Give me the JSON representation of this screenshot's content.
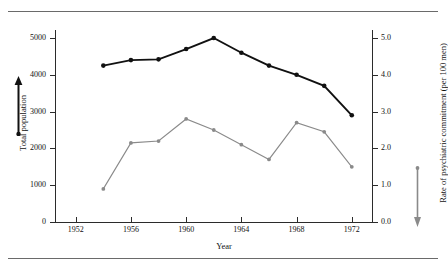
{
  "figure": {
    "background": "#ffffff",
    "rules": [
      "top-rule",
      "bottom-rule"
    ]
  },
  "axes": {
    "left": {
      "title": "Total population",
      "ticks": [
        "0",
        "1000",
        "2000",
        "3000",
        "4000",
        "5000"
      ],
      "tick_values": [
        0,
        1000,
        2000,
        3000,
        4000,
        5000
      ],
      "color": "#111111"
    },
    "right": {
      "title": "Rate of psychiatric commitment (per 100 men)",
      "ticks": [
        "0.0",
        "1.0",
        "2.0",
        "3.0",
        "4.0",
        "5.0"
      ],
      "tick_values": [
        0.0,
        1.0,
        2.0,
        3.0,
        4.0,
        5.0
      ],
      "color": "#111111"
    },
    "x": {
      "title": "Year",
      "ticks": [
        "1952",
        "1956",
        "1960",
        "1964",
        "1968",
        "1972"
      ],
      "tick_values": [
        1952,
        1956,
        1960,
        1964,
        1968,
        1972
      ]
    }
  },
  "annotations": {
    "left_arrow": {
      "name": "total-population-arrow",
      "direction": "up",
      "color": "#111111"
    },
    "right_arrow": {
      "name": "commitment-rate-arrow",
      "direction": "down",
      "color": "#8a8a8a"
    }
  },
  "chart_data": {
    "type": "line",
    "title": "",
    "xlabel": "Year",
    "ylabel": "Total population",
    "y2label": "Rate of psychiatric commitment (per 100 men)",
    "x": [
      1954,
      1956,
      1958,
      1960,
      1962,
      1964,
      1966,
      1968,
      1970,
      1972
    ],
    "xlim": [
      1950.5,
      1973.5
    ],
    "ylim": [
      0,
      5400
    ],
    "y2lim": [
      0.0,
      5.4
    ],
    "grid": false,
    "legend": "none",
    "series": [
      {
        "name": "Total population",
        "axis": "left",
        "color": "#111111",
        "marker": "filled-circle",
        "line_width": 1.9,
        "values": [
          4250,
          4400,
          4420,
          4700,
          5000,
          4600,
          4250,
          4000,
          3700,
          2900
        ]
      },
      {
        "name": "Rate of psychiatric commitment (per 100 men)",
        "axis": "right",
        "color": "#8a8a8a",
        "marker": "filled-circle",
        "line_width": 1.1,
        "values": [
          0.9,
          2.15,
          2.2,
          2.8,
          2.5,
          2.1,
          1.7,
          2.7,
          2.45,
          1.5
        ]
      }
    ]
  }
}
